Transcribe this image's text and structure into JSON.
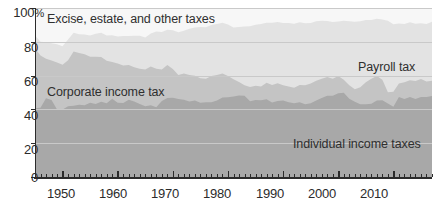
{
  "chart_data": {
    "type": "area",
    "title": "",
    "subtitle": "",
    "xlabel": "",
    "ylabel": "",
    "stacked": true,
    "stacked_to_100": true,
    "grid": true,
    "grid_orientation": "horizontal",
    "legend_position": "inline-labels",
    "xlim": [
      1945,
      2017
    ],
    "ylim": [
      0,
      100
    ],
    "yticks": [
      0,
      20,
      40,
      60,
      80,
      100
    ],
    "ytick_labels": [
      "0",
      "20",
      "40",
      "60",
      "80",
      "100%"
    ],
    "xticks": [
      1950,
      1960,
      1970,
      1980,
      1990,
      2000,
      2010
    ],
    "xtick_labels": [
      "1950",
      "1960",
      "1970",
      "1980",
      "1990",
      "2000",
      "2010"
    ],
    "minor_xticks_interval": 1,
    "x": [
      1945,
      1946,
      1947,
      1948,
      1949,
      1950,
      1951,
      1952,
      1953,
      1954,
      1955,
      1956,
      1957,
      1958,
      1959,
      1960,
      1961,
      1962,
      1963,
      1964,
      1965,
      1966,
      1967,
      1968,
      1969,
      1970,
      1971,
      1972,
      1973,
      1974,
      1975,
      1976,
      1977,
      1978,
      1979,
      1980,
      1981,
      1982,
      1983,
      1984,
      1985,
      1986,
      1987,
      1988,
      1989,
      1990,
      1991,
      1992,
      1993,
      1994,
      1995,
      1996,
      1997,
      1998,
      1999,
      2000,
      2001,
      2002,
      2003,
      2004,
      2005,
      2006,
      2007,
      2008,
      2009,
      2010,
      2011,
      2012,
      2013,
      2014,
      2015,
      2016,
      2017
    ],
    "series": [
      {
        "name": "Individual income taxes",
        "color": "#a8a8a8",
        "label_x_year": 1999,
        "label_y_pct": 23,
        "values": [
          40.7,
          41.0,
          46.6,
          45.6,
          40.0,
          39.9,
          41.8,
          42.2,
          42.8,
          42.4,
          43.9,
          43.2,
          44.5,
          43.6,
          46.3,
          44.0,
          43.8,
          45.7,
          44.7,
          43.2,
          41.8,
          42.4,
          41.3,
          44.9,
          46.7,
          46.9,
          46.1,
          45.7,
          44.7,
          45.2,
          43.9,
          44.2,
          44.3,
          45.3,
          47.0,
          47.2,
          47.7,
          48.2,
          48.1,
          44.8,
          45.6,
          45.4,
          46.0,
          44.1,
          45.0,
          45.2,
          44.3,
          43.6,
          44.2,
          43.1,
          43.7,
          45.2,
          46.7,
          48.1,
          48.1,
          49.6,
          49.9,
          46.3,
          44.5,
          43.0,
          43.1,
          43.4,
          45.3,
          45.4,
          43.5,
          41.5,
          47.4,
          46.2,
          47.4,
          46.2,
          47.4,
          47.3,
          47.9
        ]
      },
      {
        "name": "Corporate income tax",
        "color": "#c4c4c4",
        "label_x_year": 1953,
        "label_y_pct": 55,
        "values": [
          35.4,
          30.9,
          23.3,
          23.3,
          27.7,
          26.5,
          27.3,
          32.1,
          30.5,
          30.3,
          27.3,
          28.0,
          26.5,
          25.2,
          21.8,
          23.2,
          22.2,
          20.6,
          20.3,
          20.9,
          21.8,
          23.0,
          22.8,
          18.7,
          19.6,
          17.0,
          14.3,
          15.5,
          15.7,
          14.7,
          14.6,
          13.9,
          15.4,
          15.0,
          14.2,
          12.5,
          10.2,
          8.0,
          6.2,
          8.5,
          8.4,
          8.2,
          9.8,
          10.4,
          10.4,
          9.1,
          9.3,
          9.2,
          10.2,
          11.2,
          11.6,
          11.8,
          11.5,
          11.0,
          10.1,
          10.2,
          7.6,
          8.0,
          7.4,
          10.1,
          12.9,
          14.7,
          14.4,
          12.1,
          6.6,
          8.9,
          7.9,
          9.9,
          9.9,
          10.6,
          10.6,
          9.2,
          9.0
        ]
      },
      {
        "name": "Payroll tax",
        "color": "#e3e3e3",
        "label_x_year": 2008,
        "label_y_pct": 73,
        "values": [
          7.6,
          8.2,
          9.8,
          10.3,
          10.8,
          11.0,
          12.3,
          11.1,
          11.1,
          11.6,
          12.5,
          13.5,
          14.4,
          15.0,
          15.8,
          15.9,
          17.4,
          17.1,
          18.6,
          19.5,
          19.0,
          19.5,
          22.0,
          22.2,
          20.9,
          23.0,
          25.3,
          25.4,
          27.3,
          28.5,
          30.3,
          30.5,
          30.3,
          30.3,
          30.0,
          30.5,
          30.5,
          32.6,
          34.8,
          35.9,
          36.1,
          36.9,
          35.5,
          36.8,
          36.3,
          36.8,
          37.5,
          37.9,
          37.1,
          36.7,
          35.8,
          35.1,
          34.2,
          33.2,
          33.5,
          32.2,
          34.9,
          37.8,
          40.0,
          39.0,
          36.9,
          34.8,
          33.9,
          35.7,
          42.3,
          40.0,
          35.5,
          34.5,
          34.2,
          33.9,
          33.0,
          34.1,
          35.0
        ]
      },
      {
        "name": "Excise, estate, and other taxes",
        "color": "#f7f7f7",
        "label_x_year": 1948,
        "label_y_pct": 91,
        "values": [
          16.3,
          19.9,
          20.3,
          20.8,
          21.5,
          22.6,
          18.6,
          14.6,
          15.6,
          15.7,
          16.3,
          15.3,
          14.6,
          16.2,
          16.1,
          16.9,
          16.6,
          16.6,
          16.4,
          16.4,
          17.4,
          15.1,
          13.9,
          14.2,
          12.8,
          13.1,
          14.3,
          13.4,
          12.3,
          11.6,
          11.2,
          11.4,
          10.0,
          9.4,
          8.8,
          9.8,
          11.6,
          11.2,
          10.9,
          10.8,
          9.9,
          9.5,
          8.7,
          8.7,
          8.3,
          8.9,
          8.9,
          9.3,
          8.5,
          9.0,
          8.9,
          7.9,
          7.6,
          7.7,
          8.3,
          8.0,
          7.6,
          7.9,
          8.1,
          7.9,
          7.1,
          7.1,
          6.4,
          6.8,
          7.6,
          9.6,
          9.2,
          9.4,
          8.5,
          9.3,
          9.0,
          9.4,
          8.1
        ]
      }
    ]
  },
  "axes": {
    "ytick_labels": [
      "100%",
      "80",
      "60",
      "40",
      "20",
      "0"
    ],
    "xtick_labels": [
      "1950",
      "1960",
      "1970",
      "1980",
      "1990",
      "2000",
      "2010"
    ]
  },
  "series_labels": [
    {
      "name": "excise-estate-other-taxes",
      "text": "Excise, estate, and other taxes"
    },
    {
      "name": "payroll-tax",
      "text": "Payroll tax"
    },
    {
      "name": "corporate-income-tax",
      "text": "Corporate income tax"
    },
    {
      "name": "individual-income-taxes",
      "text": "Individual income taxes"
    }
  ],
  "colors": {
    "individual_income_taxes": "#a8a8a8",
    "corporate_income_tax": "#c4c4c4",
    "payroll_tax": "#e3e3e3",
    "excise_estate_other": "#f7f7f7",
    "gridline": "#c9c9c9",
    "axis": "#2b2b2b",
    "text": "#2b2b2b",
    "background": "#ffffff"
  }
}
